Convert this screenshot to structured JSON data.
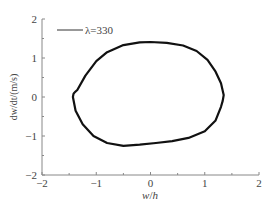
{
  "chart_data": {
    "type": "line",
    "title": "",
    "xlabel": "w/h",
    "ylabel": "dw/dt/(m/s)",
    "xlim": [
      -2,
      2
    ],
    "ylim": [
      -2,
      2
    ],
    "xticks": [
      "-2",
      "-1",
      "0",
      "1",
      "2"
    ],
    "yticks": [
      "-2",
      "-1",
      "0",
      "1",
      "2"
    ],
    "grid": false,
    "legend": {
      "position": "upper-left",
      "entries": [
        "λ=330"
      ]
    },
    "series": [
      {
        "name": "λ=330",
        "color": "#111111",
        "x": [
          -1.4,
          -1.35,
          -1.2,
          -1.0,
          -0.8,
          -0.5,
          -0.2,
          0.0,
          0.3,
          0.6,
          0.85,
          1.05,
          1.2,
          1.3,
          1.35,
          1.33,
          1.3,
          1.2,
          1.0,
          0.7,
          0.4,
          0.1,
          -0.2,
          -0.5,
          -0.8,
          -1.05,
          -1.25,
          -1.38,
          -1.43,
          -1.42,
          -1.4
        ],
        "y": [
          0.12,
          0.18,
          0.55,
          0.92,
          1.15,
          1.33,
          1.4,
          1.41,
          1.39,
          1.32,
          1.18,
          0.95,
          0.65,
          0.35,
          0.05,
          -0.1,
          -0.25,
          -0.6,
          -0.88,
          -1.05,
          -1.13,
          -1.18,
          -1.22,
          -1.25,
          -1.18,
          -1.0,
          -0.7,
          -0.35,
          0.0,
          0.08,
          0.12
        ]
      }
    ]
  },
  "labels": {
    "xlabel_w": "w",
    "xlabel_sep": "/",
    "xlabel_h": "h",
    "ylabel": "dw/dt/(m/s)",
    "legend": "λ=330"
  }
}
